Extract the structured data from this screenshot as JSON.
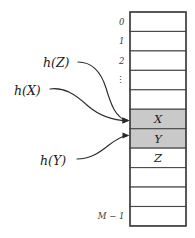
{
  "figure": {
    "colors": {
      "shaded_cell": "#c9c9c9",
      "empty_cell": "#ffffff",
      "cell_border": "#4a4a4a",
      "table_outline": "#3c3c3c",
      "arrow": "#2b2b2b",
      "text": "#1a1a1a"
    }
  },
  "table": {
    "name": "hash-table",
    "row_count": 11,
    "geometry": {
      "left": 130,
      "right": 186,
      "top": 12,
      "bottom": 226,
      "row_height": 19.45
    },
    "rows": [
      {
        "index_label": "0",
        "value": "",
        "shaded": false
      },
      {
        "index_label": "1",
        "value": "",
        "shaded": false
      },
      {
        "index_label": "2",
        "value": "",
        "shaded": false
      },
      {
        "index_label": "⋮",
        "value": "",
        "shaded": false
      },
      {
        "index_label": "",
        "value": "",
        "shaded": false
      },
      {
        "index_label": "",
        "value": "X",
        "shaded": true
      },
      {
        "index_label": "",
        "value": "Y",
        "shaded": true
      },
      {
        "index_label": "",
        "value": "Z",
        "shaded": false
      },
      {
        "index_label": "",
        "value": "",
        "shaded": false
      },
      {
        "index_label": "",
        "value": "",
        "shaded": false
      },
      {
        "index_label": "M − 1",
        "value": "",
        "shaded": false
      }
    ]
  },
  "hash_labels": [
    {
      "id": "h-of-z",
      "text": "h(Z)",
      "x": 43,
      "y": 67,
      "target_row": 5
    },
    {
      "id": "h-of-x",
      "text": "h(X)",
      "x": 14,
      "y": 95,
      "target_row": 5
    },
    {
      "id": "h-of-y",
      "text": "h(Y)",
      "x": 40,
      "y": 165,
      "target_row": 6
    }
  ],
  "arrows": [
    {
      "id": "arrow-hz-to-x",
      "from": "h(Z)",
      "to_cell": "X",
      "path": "M 78 62 C 93 62, 101 72, 106 88 C 111 105, 116 118, 127 120.5"
    },
    {
      "id": "arrow-hx-to-x",
      "from": "h(X)",
      "to_cell": "X",
      "path": "M 50 89 C 64 87, 75 94, 88 106 C 101 117, 113 120.5, 127 120.5"
    },
    {
      "id": "arrow-hy-to-y",
      "from": "h(Y)",
      "to_cell": "Y",
      "path": "M 77 159 C 90 159, 99 153, 109 145 C 117 139, 122 136, 127 135.5"
    }
  ]
}
